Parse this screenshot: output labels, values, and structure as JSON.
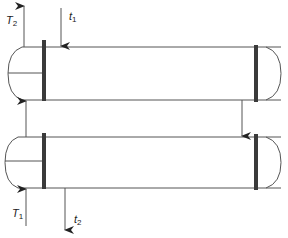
{
  "diagram": {
    "stroke_color": "#555555",
    "tubesheet_color": "#3a3a3a",
    "labels": {
      "T2": {
        "main": "T",
        "sub": "2"
      },
      "t1": {
        "main": "t",
        "sub": "1"
      },
      "T1": {
        "main": "T",
        "sub": "1"
      },
      "t2": {
        "main": "t",
        "sub": "2"
      }
    },
    "shells": [
      {
        "name": "upper-shell",
        "top": 47,
        "bottom": 100
      },
      {
        "name": "lower-shell",
        "top": 137,
        "bottom": 188
      }
    ],
    "flows": [
      {
        "name": "T2-outlet",
        "direction": "up"
      },
      {
        "name": "t1-inlet",
        "direction": "down"
      },
      {
        "name": "crossover",
        "direction": "down"
      },
      {
        "name": "T1-inlet",
        "direction": "up"
      },
      {
        "name": "t2-outlet",
        "direction": "down"
      }
    ]
  }
}
